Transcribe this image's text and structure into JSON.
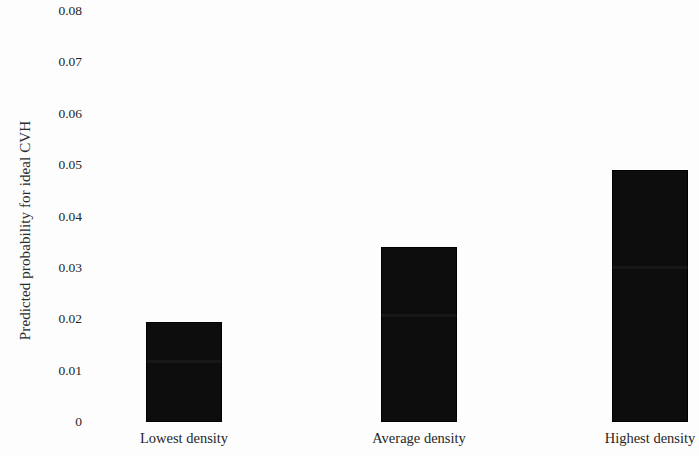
{
  "chart_data": {
    "type": "bar",
    "title": "",
    "subtitle": "",
    "xlabel": "",
    "ylabel": "Predicted probability for ideal CVH",
    "categories": [
      "Lowest density",
      "Average density",
      "Highest density"
    ],
    "values": [
      0.0195,
      0.034,
      0.049
    ],
    "ylim": [
      0,
      0.08
    ],
    "ytick_labels": [
      "0.08",
      "0.07",
      "0.06",
      "0.05",
      "0.04",
      "0.03",
      "0.02",
      "0.01",
      "0"
    ],
    "ytick_values": [
      0.08,
      0.07,
      0.06,
      0.05,
      0.04,
      0.03,
      0.02,
      0.01,
      0
    ],
    "grid": false,
    "legend": null,
    "legend_position": "none",
    "bar_color": "#0d0d0d",
    "background_color": "#fdfdfd",
    "annotations": []
  }
}
